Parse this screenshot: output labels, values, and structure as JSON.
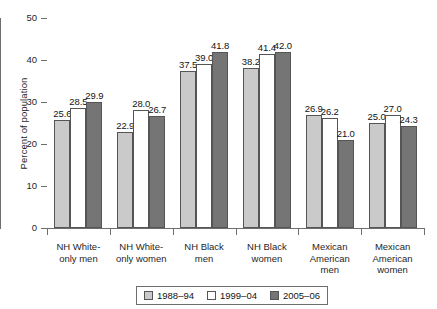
{
  "chart_data": {
    "type": "bar",
    "title": "",
    "xlabel": "",
    "ylabel": "Percent of population",
    "ylim": [
      0,
      50
    ],
    "yticks": [
      "0",
      "10",
      "20",
      "30",
      "40",
      "50"
    ],
    "grid": false,
    "legend_position": "bottom",
    "categories": [
      "NH White-\nonly men",
      "NH White-\nonly women",
      "NH Black\nmen",
      "NH Black\nwomen",
      "Mexican\nAmerican\nmen",
      "Mexican\nAmerican\nwomen"
    ],
    "category_lines": [
      [
        "NH White-",
        "only men"
      ],
      [
        "NH White-",
        "only women"
      ],
      [
        "NH Black",
        "men"
      ],
      [
        "NH Black",
        "women"
      ],
      [
        "Mexican",
        "American",
        "men"
      ],
      [
        "Mexican",
        "American",
        "women"
      ]
    ],
    "series": [
      {
        "name": "1988–94",
        "color": "#cacaca",
        "values": [
          25.6,
          22.9,
          37.5,
          38.2,
          26.9,
          25.0
        ],
        "labels": [
          "25.6",
          "22.9",
          "37.5",
          "38.2",
          "26.9",
          "25.0"
        ]
      },
      {
        "name": "1999–04",
        "color": "#ffffff",
        "values": [
          28.5,
          28.0,
          39.0,
          41.4,
          26.2,
          27.0
        ],
        "labels": [
          "28.5",
          "28.0",
          "39.0",
          "41.4",
          "26.2",
          "27.0"
        ]
      },
      {
        "name": "2005–06",
        "color": "#757575",
        "values": [
          29.9,
          26.7,
          41.8,
          42.0,
          21.0,
          24.3
        ],
        "labels": [
          "29.9",
          "26.7",
          "41.8",
          "42.0",
          "21.0",
          "24.3"
        ]
      }
    ]
  },
  "colors": {
    "series_1988_94": "#cacaca",
    "series_1999_04": "#ffffff",
    "series_2005_06": "#757575",
    "axis": "#6e6e6e",
    "bar_outline": "#555555",
    "text": "#141414",
    "background": "#ffffff"
  }
}
